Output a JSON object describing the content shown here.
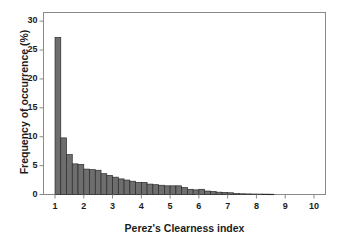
{
  "chart_data": {
    "type": "bar",
    "title": "",
    "subtitle": "",
    "xlabel": "Perez's Clearness index",
    "ylabel": "Frequency of occurrence (%)",
    "xlim": [
      0.6,
      10.4
    ],
    "ylim": [
      0,
      31.5
    ],
    "grid": false,
    "legend": null,
    "bar_width": 0.2,
    "bar_color": "#6e6e6e",
    "bar_edge_color": "#2b2b2b",
    "axis_color": "#8a8a8a",
    "text_color": "#1c1c1c",
    "xticks": [
      1,
      2,
      3,
      4,
      5,
      6,
      7,
      8,
      9,
      10
    ],
    "xtick_labels": [
      "1",
      "2",
      "3",
      "4",
      "5",
      "6",
      "7",
      "8",
      "9",
      "10"
    ],
    "yticks": [
      0,
      5,
      10,
      15,
      20,
      25,
      30
    ],
    "ytick_labels": [
      "0",
      "5",
      "10",
      "15",
      "20",
      "25",
      "30"
    ],
    "categories": [
      "1.0",
      "1.2",
      "1.4",
      "1.6",
      "1.8",
      "2.0",
      "2.2",
      "2.4",
      "2.6",
      "2.8",
      "3.0",
      "3.2",
      "3.4",
      "3.6",
      "3.8",
      "4.0",
      "4.2",
      "4.4",
      "4.6",
      "4.8",
      "5.0",
      "5.2",
      "5.4",
      "5.6",
      "5.8",
      "6.0",
      "6.2",
      "6.4",
      "6.6",
      "6.8",
      "7.0",
      "7.2",
      "7.4",
      "7.6",
      "7.8",
      "8.0",
      "8.2",
      "8.4",
      "8.6",
      "8.8"
    ],
    "values": [
      27.2,
      9.8,
      6.9,
      5.3,
      5.2,
      4.4,
      4.3,
      4.2,
      3.6,
      3.3,
      3.0,
      2.7,
      2.5,
      2.3,
      2.1,
      2.1,
      1.8,
      1.7,
      1.6,
      1.5,
      1.5,
      1.5,
      1.2,
      0.9,
      0.8,
      0.9,
      0.6,
      0.5,
      0.4,
      0.35,
      0.3,
      0.15,
      0.12,
      0.1,
      0.08,
      0.07,
      0.06,
      0.05,
      0.0,
      0.0
    ]
  }
}
